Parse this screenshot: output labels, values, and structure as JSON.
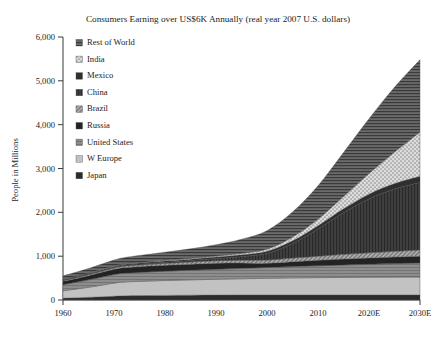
{
  "chart_data": {
    "type": "area",
    "title": "Consumers Earning over US$6K Annually (real year 2007 U.S. dollars)",
    "xlabel": "",
    "ylabel": "People in Millions",
    "stacked": true,
    "grid": false,
    "legend_position": "top-left",
    "xlim": [
      1960,
      2030
    ],
    "ylim": [
      0,
      6000
    ],
    "ytick_labels": [
      "0",
      "1,000",
      "2,000",
      "3,000",
      "4,000",
      "5,000",
      "6,000"
    ],
    "ytick_values": [
      0,
      1000,
      2000,
      3000,
      4000,
      5000,
      6000
    ],
    "xtick_labels": [
      "1960",
      "1970",
      "1980",
      "1990",
      "2000",
      "2010",
      "2020E",
      "2030E"
    ],
    "xtick_values": [
      1960,
      1970,
      1980,
      1990,
      2000,
      2010,
      2020,
      2030
    ],
    "x": [
      1960,
      1965,
      1970,
      1972,
      1975,
      1980,
      1985,
      1990,
      1995,
      2000,
      2005,
      2010,
      2015,
      2020,
      2025,
      2030
    ],
    "series": [
      {
        "name": "Japan",
        "pattern": "solid-dark",
        "color": "#2b2b2b",
        "values": [
          40,
          60,
          85,
          95,
          100,
          105,
          110,
          112,
          115,
          115,
          115,
          115,
          115,
          115,
          115,
          115
        ]
      },
      {
        "name": "W Europe",
        "pattern": "solid-light",
        "color": "#c2c2c2",
        "values": [
          170,
          230,
          300,
          315,
          325,
          340,
          350,
          360,
          370,
          380,
          390,
          395,
          400,
          405,
          408,
          410
        ]
      },
      {
        "name": "United States",
        "pattern": "solid-medium",
        "color": "#8a8a8a",
        "values": [
          140,
          170,
          195,
          200,
          205,
          212,
          220,
          228,
          237,
          246,
          258,
          270,
          283,
          295,
          308,
          320
        ]
      },
      {
        "name": "Russia",
        "pattern": "solid-verydark",
        "color": "#232323",
        "values": [
          75,
          95,
          120,
          128,
          130,
          133,
          136,
          138,
          120,
          95,
          110,
          125,
          135,
          142,
          148,
          152
        ]
      },
      {
        "name": "Brazil",
        "pattern": "hatch-light",
        "color": "#9e9e9e",
        "values": [
          18,
          25,
          33,
          36,
          40,
          46,
          52,
          58,
          66,
          74,
          84,
          95,
          108,
          120,
          132,
          145
        ]
      },
      {
        "name": "China",
        "pattern": "solid-darkgray",
        "color": "#3c3c3c",
        "values": [
          8,
          10,
          14,
          16,
          20,
          26,
          34,
          48,
          80,
          150,
          330,
          620,
          950,
          1230,
          1420,
          1540
        ]
      },
      {
        "name": "Mexico",
        "pattern": "solid-dark2",
        "color": "#2f2f2f",
        "values": [
          12,
          15,
          19,
          20,
          22,
          26,
          30,
          35,
          42,
          50,
          62,
          76,
          92,
          108,
          124,
          140
        ]
      },
      {
        "name": "India",
        "pattern": "dotted",
        "color": "#d5d5d5",
        "values": [
          6,
          8,
          10,
          11,
          13,
          16,
          20,
          26,
          36,
          52,
          88,
          150,
          280,
          470,
          720,
          1010
        ]
      },
      {
        "name": "Rest of World",
        "pattern": "hatch-dark",
        "color": "#5a5a5a",
        "values": [
          80,
          105,
          135,
          145,
          160,
          185,
          215,
          255,
          320,
          420,
          570,
          760,
          1000,
          1250,
          1480,
          1650
        ]
      }
    ],
    "totals_note": "Stacked total peaks near 5,250 million in 2030E"
  },
  "legend": {
    "items": [
      {
        "label": "Rest of World",
        "key": "rest-of-world"
      },
      {
        "label": "India",
        "key": "india"
      },
      {
        "label": "Mexico",
        "key": "mexico"
      },
      {
        "label": "China",
        "key": "china"
      },
      {
        "label": "Brazil",
        "key": "brazil"
      },
      {
        "label": "Russia",
        "key": "russia"
      },
      {
        "label": "United States",
        "key": "united-states"
      },
      {
        "label": "W Europe",
        "key": "w-europe"
      },
      {
        "label": "Japan",
        "key": "japan"
      }
    ]
  }
}
